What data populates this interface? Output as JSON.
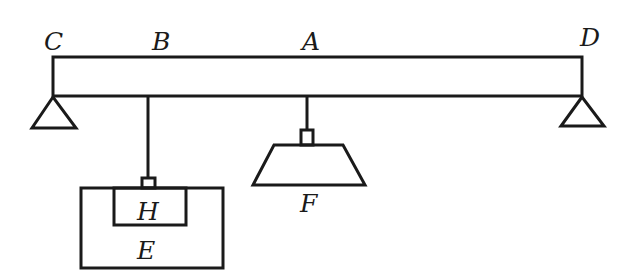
{
  "diagram": {
    "type": "lever-balance",
    "labels": {
      "C": "C",
      "B": "B",
      "A": "A",
      "D": "D",
      "H": "H",
      "E": "E",
      "F": "F"
    },
    "colors": {
      "stroke": "#1a1a1a",
      "background": "#ffffff"
    }
  }
}
